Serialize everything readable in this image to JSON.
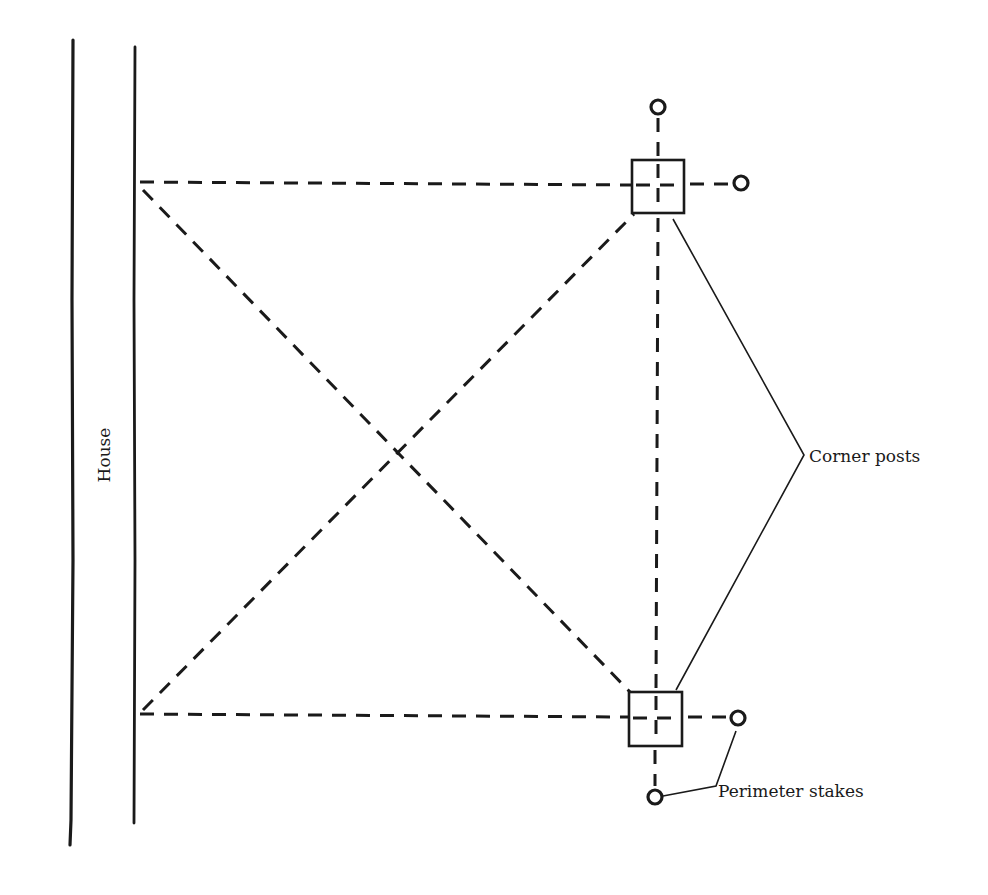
{
  "diagram": {
    "labels": {
      "house": "House",
      "corner_posts": "Corner posts",
      "perimeter_stakes": "Perimeter stakes"
    },
    "colors": {
      "ink": "#1a1a1a",
      "background": "#ffffff"
    },
    "elements": {
      "house_walls": 2,
      "corner_posts": 2,
      "perimeter_stakes": 4,
      "diagonals": 2
    }
  }
}
